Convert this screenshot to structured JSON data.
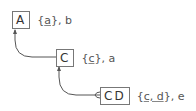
{
  "diagram": {
    "type": "tree",
    "nodes": [
      {
        "id": "A",
        "box": "A",
        "open": "{",
        "key": "a",
        "close": "}, b"
      },
      {
        "id": "C",
        "box": "C",
        "open": "{",
        "key": "c",
        "close": "}, a"
      },
      {
        "id": "CD",
        "box": "CD",
        "open": "{",
        "key": "c, d",
        "close": "}, e"
      }
    ],
    "edges": [
      {
        "from": "C",
        "to": "A"
      },
      {
        "from": "CD",
        "to": "C"
      }
    ],
    "colors": {
      "line": "#555555",
      "box_border": "#777777",
      "text": "#444444"
    }
  }
}
